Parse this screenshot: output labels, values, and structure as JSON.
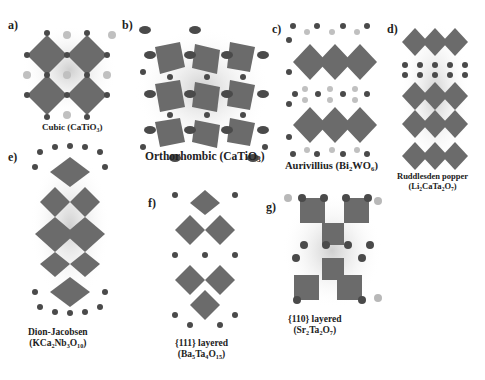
{
  "figure": {
    "colors": {
      "octahedron": "#6a6a6a",
      "octahedron_light": "#9a9a9a",
      "anion_dark": "#4a4a4a",
      "cation_light": "#b8b8b8",
      "halo": "#d9d9d9",
      "background": "#ffffff"
    },
    "panels": [
      {
        "id": "a",
        "label": "a)",
        "name": "Cubic",
        "formula_parts": [
          "(CaTiO",
          "3",
          ")"
        ],
        "caption": "Cubic (CaTiO3)"
      },
      {
        "id": "b",
        "label": "b)",
        "name": "Orthorhombic",
        "formula_parts": [
          "(CaTiO",
          "3",
          ")"
        ],
        "caption": "Orthorhombic (CaTiO3)"
      },
      {
        "id": "c",
        "label": "c)",
        "name": "Aurivillius",
        "formula_parts": [
          "(Bi",
          "2",
          "WO",
          "6",
          ")"
        ],
        "caption": "Aurivillius (Bi2WO6)"
      },
      {
        "id": "d",
        "label": "d)",
        "name": "Ruddlesden popper",
        "formula_parts": [
          "(Li",
          "2",
          "CaTa",
          "2",
          "O",
          "7",
          ")"
        ],
        "caption": "Ruddlesden popper (Li2CaTa2O7)"
      },
      {
        "id": "e",
        "label": "e)",
        "name": "Dion-Jacobsen",
        "formula_parts": [
          "(KCa",
          "2",
          "Nb",
          "3",
          "O",
          "10",
          ")"
        ],
        "caption": "Dion-Jacobsen (KCa2Nb3O10)"
      },
      {
        "id": "f",
        "label": "f)",
        "name": "{111} layered",
        "formula_parts": [
          "(Ba",
          "5",
          "Ta",
          "4",
          "O",
          "15",
          ")"
        ],
        "caption": "{111} layered (Ba5Ta4O15)"
      },
      {
        "id": "g",
        "label": "g)",
        "name": "{110} layered",
        "formula_parts": [
          "(Sr",
          "2",
          "Ta",
          "2",
          "O",
          "7",
          ")"
        ],
        "caption": "{110} layered (Sr2Ta2O7)"
      }
    ]
  }
}
